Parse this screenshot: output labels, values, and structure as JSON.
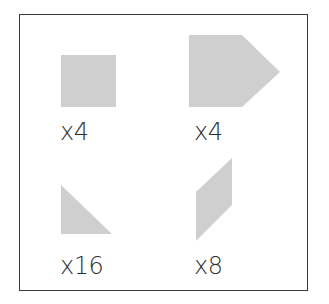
{
  "figure": {
    "shape_fill": "#cfcfcf",
    "border_color": "#3a3a3a",
    "text_color": "#2e2e2e",
    "items": [
      {
        "shape": "square",
        "label": "x4"
      },
      {
        "shape": "pentagon",
        "label": "x4"
      },
      {
        "shape": "right-triangle",
        "label": "x16"
      },
      {
        "shape": "parallelogram",
        "label": "x8"
      }
    ]
  }
}
